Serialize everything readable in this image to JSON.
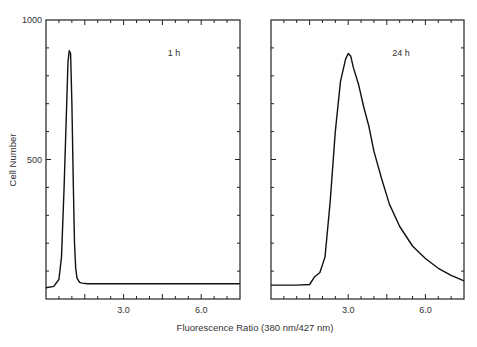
{
  "figure": {
    "ylabel": "Cell Number",
    "xlabel": "Fluorescence Ratio (380 nm/427 nm)"
  },
  "chart_data": [
    {
      "type": "line",
      "panel": "left",
      "annotation": "1 h",
      "xlabel": "Fluorescence Ratio (380 nm/427 nm)",
      "ylabel": "Cell Number",
      "xlim": [
        0,
        7.5
      ],
      "ylim": [
        0,
        1000
      ],
      "x_ticks": [
        3.0,
        6.0
      ],
      "x_tick_labels": [
        "3.0",
        "6.0"
      ],
      "y_ticks": [
        500,
        1000
      ],
      "y_tick_labels": [
        "500",
        "1000"
      ],
      "grid": false,
      "x": [
        0.0,
        0.3,
        0.5,
        0.6,
        0.7,
        0.8,
        0.85,
        0.9,
        0.95,
        1.0,
        1.05,
        1.1,
        1.15,
        1.2,
        1.3,
        1.4,
        1.6,
        2.0,
        3.0,
        4.0,
        5.0,
        6.0,
        7.0,
        7.5
      ],
      "y": [
        40,
        45,
        70,
        150,
        400,
        700,
        850,
        890,
        880,
        700,
        430,
        200,
        110,
        75,
        60,
        57,
        55,
        55,
        55,
        55,
        55,
        55,
        55,
        55
      ]
    },
    {
      "type": "line",
      "panel": "right",
      "annotation": "24 h",
      "xlabel": "Fluorescence Ratio (380 nm/427 nm)",
      "ylabel": "Cell Number",
      "xlim": [
        0,
        7.5
      ],
      "ylim": [
        0,
        1000
      ],
      "x_ticks": [
        3.0,
        6.0
      ],
      "x_tick_labels": [
        "3.0",
        "6.0"
      ],
      "y_ticks": [
        500,
        1000
      ],
      "y_tick_labels": [
        "500",
        "1000"
      ],
      "grid": false,
      "x": [
        0.0,
        0.5,
        1.0,
        1.5,
        1.7,
        1.9,
        2.1,
        2.3,
        2.5,
        2.7,
        2.9,
        3.0,
        3.1,
        3.2,
        3.4,
        3.6,
        3.8,
        4.0,
        4.3,
        4.6,
        5.0,
        5.5,
        6.0,
        6.5,
        7.0,
        7.5
      ],
      "y": [
        50,
        50,
        50,
        52,
        80,
        95,
        150,
        350,
        600,
        780,
        860,
        880,
        870,
        830,
        770,
        690,
        620,
        530,
        430,
        340,
        260,
        190,
        145,
        110,
        85,
        65
      ]
    }
  ]
}
